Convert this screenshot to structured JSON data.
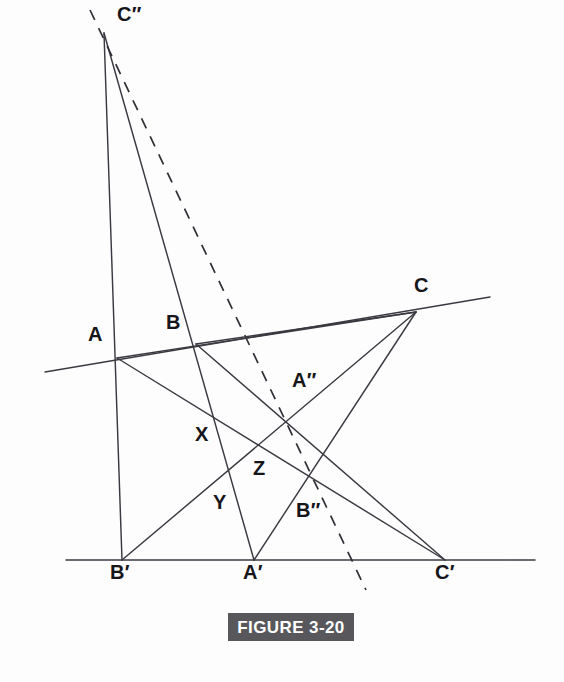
{
  "figure": {
    "caption": "FIGURE 3-20",
    "caption_bg": "#58585c",
    "caption_color": "#ffffff",
    "line_color": "#3a3a42",
    "background": "#ffffff",
    "width": 564,
    "height": 682
  },
  "labels": [
    {
      "id": "C2",
      "text": "C″",
      "x": 117,
      "y": 4
    },
    {
      "id": "A",
      "text": "A",
      "x": 88,
      "y": 324
    },
    {
      "id": "B",
      "text": "B",
      "x": 166,
      "y": 312
    },
    {
      "id": "C",
      "text": "C",
      "x": 414,
      "y": 275
    },
    {
      "id": "A2",
      "text": "A″",
      "x": 292,
      "y": 370
    },
    {
      "id": "X",
      "text": "X",
      "x": 195,
      "y": 424
    },
    {
      "id": "Z",
      "text": "Z",
      "x": 253,
      "y": 458
    },
    {
      "id": "Y",
      "text": "Y",
      "x": 213,
      "y": 492
    },
    {
      "id": "B2",
      "text": "B″",
      "x": 296,
      "y": 500
    },
    {
      "id": "B1",
      "text": "B′",
      "x": 110,
      "y": 562
    },
    {
      "id": "A1",
      "text": "A′",
      "x": 243,
      "y": 562
    },
    {
      "id": "C1",
      "text": "C′",
      "x": 435,
      "y": 562
    }
  ],
  "points": {
    "A": {
      "x": 117,
      "y": 358
    },
    "B": {
      "x": 196,
      "y": 344
    },
    "C": {
      "x": 416,
      "y": 312
    },
    "Ap": {
      "x": 254,
      "y": 560
    },
    "Bp": {
      "x": 122,
      "y": 560
    },
    "Cp": {
      "x": 445,
      "y": 560
    },
    "App": {
      "x": 288,
      "y": 418
    },
    "Bpp": {
      "x": 310,
      "y": 478
    },
    "Cpp": {
      "x": 104,
      "y": 33
    },
    "X": {
      "x": 216,
      "y": 447
    },
    "Y": {
      "x": 237,
      "y": 478
    },
    "Z": {
      "x": 248,
      "y": 440
    }
  },
  "segments": [
    {
      "name": "top-transversal-line",
      "kind": "solid",
      "x1": 45,
      "y1": 372,
      "x2": 490,
      "y2": 297
    },
    {
      "name": "baseline-line",
      "kind": "solid",
      "x1": 66,
      "y1": 560,
      "x2": 535,
      "y2": 560
    },
    {
      "name": "segment-Cpp-to-Bp",
      "kind": "solid",
      "x1": 104,
      "y1": 33,
      "x2": 122,
      "y2": 560
    },
    {
      "name": "segment-Cpp-to-Ap",
      "kind": "solid",
      "x1": 104,
      "y1": 33,
      "x2": 254,
      "y2": 560
    },
    {
      "name": "dashed-axis-line",
      "kind": "dashed",
      "x1": 90,
      "y1": 10,
      "x2": 366,
      "y2": 590
    },
    {
      "name": "segment-A-to-Cp",
      "kind": "solid",
      "x1": 117,
      "y1": 358,
      "x2": 445,
      "y2": 560
    },
    {
      "name": "segment-B-to-Cp",
      "kind": "solid",
      "x1": 196,
      "y1": 344,
      "x2": 445,
      "y2": 560
    },
    {
      "name": "segment-C-to-Bp",
      "kind": "solid",
      "x1": 416,
      "y1": 312,
      "x2": 122,
      "y2": 560
    },
    {
      "name": "segment-C-to-Ap",
      "kind": "solid",
      "x1": 416,
      "y1": 312,
      "x2": 254,
      "y2": 560
    },
    {
      "name": "segment-C-to-B",
      "kind": "solid",
      "x1": 416,
      "y1": 312,
      "x2": 196,
      "y2": 344
    },
    {
      "name": "segment-C-to-A",
      "kind": "solid",
      "x1": 416,
      "y1": 312,
      "x2": 117,
      "y2": 358
    }
  ],
  "chart_data": {
    "type": "diagram",
    "title": "FIGURE 3-20",
    "vertex_labels": [
      "C″",
      "A",
      "B",
      "C",
      "A″",
      "X",
      "Z",
      "Y",
      "B″",
      "B′",
      "A′",
      "C′"
    ]
  }
}
